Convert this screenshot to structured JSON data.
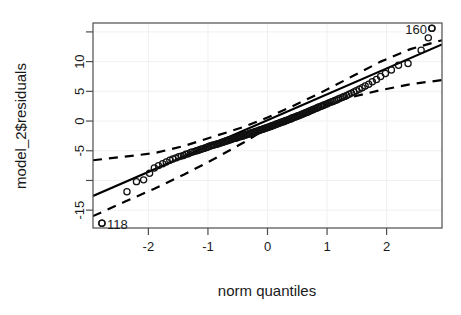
{
  "chart_data": {
    "type": "scatter",
    "title": "",
    "xlabel": "norm quantiles",
    "ylabel": "model_2$residuals",
    "xlim": [
      -2.93,
      2.93
    ],
    "ylim": [
      -18.0,
      16.5
    ],
    "grid": true,
    "legend": null,
    "xticks": [
      -2,
      -1,
      0,
      1,
      2
    ],
    "xticklabels": [
      "-2",
      "-1",
      "0",
      "1",
      "2"
    ],
    "yticks": [
      15,
      10,
      5,
      0,
      -5,
      -10,
      -15
    ],
    "yticklabels": [
      "",
      "10",
      "5",
      "0",
      "-5",
      "",
      "-15"
    ],
    "marker": "open-circle",
    "reference_line": {
      "style": "solid",
      "intercept": 0.15,
      "slope": 4.35
    },
    "confidence_envelope": {
      "style": "dashed",
      "upper": [
        [
          -2.93,
          -6.6
        ],
        [
          -2.4,
          -6.0
        ],
        [
          -1.9,
          -5.4
        ],
        [
          -1.4,
          -4.2
        ],
        [
          -0.9,
          -2.6
        ],
        [
          -0.4,
          -1.0
        ],
        [
          0.0,
          0.6
        ],
        [
          0.4,
          2.4
        ],
        [
          0.9,
          4.8
        ],
        [
          1.4,
          7.4
        ],
        [
          1.9,
          10.0
        ],
        [
          2.4,
          12.1
        ],
        [
          2.93,
          13.6
        ]
      ],
      "lower": [
        [
          -2.93,
          -16.0
        ],
        [
          -2.4,
          -13.6
        ],
        [
          -1.9,
          -11.4
        ],
        [
          -1.4,
          -9.0
        ],
        [
          -0.9,
          -6.4
        ],
        [
          -0.4,
          -3.6
        ],
        [
          0.0,
          -1.2
        ],
        [
          0.4,
          0.7
        ],
        [
          0.9,
          2.6
        ],
        [
          1.4,
          4.0
        ],
        [
          1.9,
          5.2
        ],
        [
          2.4,
          6.2
        ],
        [
          2.93,
          6.9
        ]
      ]
    },
    "annotations": [
      {
        "label": "160",
        "x": 2.76,
        "y": 15.6,
        "position": "left"
      },
      {
        "label": "118",
        "x": -2.78,
        "y": -17.2,
        "position": "right"
      }
    ],
    "points": [
      [
        -2.78,
        -17.2
      ],
      [
        -2.36,
        -11.9
      ],
      [
        -2.2,
        -10.2
      ],
      [
        -2.08,
        -9.9
      ],
      [
        -1.98,
        -8.8
      ],
      [
        -1.9,
        -7.9
      ],
      [
        -1.83,
        -7.5
      ],
      [
        -1.76,
        -7.2
      ],
      [
        -1.7,
        -6.9
      ],
      [
        -1.64,
        -6.6
      ],
      [
        -1.59,
        -6.4
      ],
      [
        -1.54,
        -6.2
      ],
      [
        -1.49,
        -6.0
      ],
      [
        -1.45,
        -5.9
      ],
      [
        -1.41,
        -5.8
      ],
      [
        -1.37,
        -5.6
      ],
      [
        -1.33,
        -5.5
      ],
      [
        -1.29,
        -5.3
      ],
      [
        -1.26,
        -5.2
      ],
      [
        -1.22,
        -5.1
      ],
      [
        -1.19,
        -5.0
      ],
      [
        -1.16,
        -4.9
      ],
      [
        -1.13,
        -4.8
      ],
      [
        -1.1,
        -4.7
      ],
      [
        -1.07,
        -4.6
      ],
      [
        -1.04,
        -4.5
      ],
      [
        -1.01,
        -4.4
      ],
      [
        -0.99,
        -4.3
      ],
      [
        -0.96,
        -4.2
      ],
      [
        -0.94,
        -4.1
      ],
      [
        -0.91,
        -4.05
      ],
      [
        -0.89,
        -4.0
      ],
      [
        -0.86,
        -3.9
      ],
      [
        -0.84,
        -3.85
      ],
      [
        -0.82,
        -3.8
      ],
      [
        -0.79,
        -3.7
      ],
      [
        -0.77,
        -3.6
      ],
      [
        -0.75,
        -3.55
      ],
      [
        -0.73,
        -3.5
      ],
      [
        -0.71,
        -3.4
      ],
      [
        -0.69,
        -3.35
      ],
      [
        -0.67,
        -3.3
      ],
      [
        -0.65,
        -3.2
      ],
      [
        -0.63,
        -3.15
      ],
      [
        -0.61,
        -3.1
      ],
      [
        -0.59,
        -3.0
      ],
      [
        -0.57,
        -2.95
      ],
      [
        -0.55,
        -2.9
      ],
      [
        -0.53,
        -2.85
      ],
      [
        -0.51,
        -2.8
      ],
      [
        -0.49,
        -2.7
      ],
      [
        -0.47,
        -2.65
      ],
      [
        -0.45,
        -2.6
      ],
      [
        -0.43,
        -2.55
      ],
      [
        -0.41,
        -2.5
      ],
      [
        -0.4,
        -2.4
      ],
      [
        -0.38,
        -2.35
      ],
      [
        -0.36,
        -2.3
      ],
      [
        -0.34,
        -2.25
      ],
      [
        -0.32,
        -2.2
      ],
      [
        -0.3,
        -2.1
      ],
      [
        -0.29,
        -2.05
      ],
      [
        -0.27,
        -2.0
      ],
      [
        -0.25,
        -1.95
      ],
      [
        -0.23,
        -1.9
      ],
      [
        -0.21,
        -1.8
      ],
      [
        -0.2,
        -1.75
      ],
      [
        -0.18,
        -1.7
      ],
      [
        -0.16,
        -1.65
      ],
      [
        -0.14,
        -1.6
      ],
      [
        -0.13,
        -1.5
      ],
      [
        -0.11,
        -1.45
      ],
      [
        -0.09,
        -1.4
      ],
      [
        -0.07,
        -1.35
      ],
      [
        -0.06,
        -1.3
      ],
      [
        -0.04,
        -1.2
      ],
      [
        -0.02,
        -1.15
      ],
      [
        0.0,
        -1.1
      ],
      [
        0.02,
        -1.0
      ],
      [
        0.04,
        -0.95
      ],
      [
        0.06,
        -0.9
      ],
      [
        0.07,
        -0.8
      ],
      [
        0.09,
        -0.75
      ],
      [
        0.11,
        -0.7
      ],
      [
        0.13,
        -0.6
      ],
      [
        0.14,
        -0.55
      ],
      [
        0.16,
        -0.5
      ],
      [
        0.18,
        -0.4
      ],
      [
        0.2,
        -0.35
      ],
      [
        0.21,
        -0.3
      ],
      [
        0.23,
        -0.2
      ],
      [
        0.25,
        -0.15
      ],
      [
        0.27,
        -0.1
      ],
      [
        0.29,
        0.0
      ],
      [
        0.3,
        0.05
      ],
      [
        0.32,
        0.1
      ],
      [
        0.34,
        0.2
      ],
      [
        0.36,
        0.25
      ],
      [
        0.38,
        0.35
      ],
      [
        0.4,
        0.4
      ],
      [
        0.41,
        0.5
      ],
      [
        0.43,
        0.55
      ],
      [
        0.45,
        0.65
      ],
      [
        0.47,
        0.7
      ],
      [
        0.49,
        0.8
      ],
      [
        0.51,
        0.85
      ],
      [
        0.53,
        0.95
      ],
      [
        0.55,
        1.0
      ],
      [
        0.57,
        1.1
      ],
      [
        0.59,
        1.2
      ],
      [
        0.61,
        1.25
      ],
      [
        0.63,
        1.35
      ],
      [
        0.65,
        1.45
      ],
      [
        0.67,
        1.5
      ],
      [
        0.69,
        1.6
      ],
      [
        0.71,
        1.7
      ],
      [
        0.73,
        1.8
      ],
      [
        0.75,
        1.85
      ],
      [
        0.77,
        1.95
      ],
      [
        0.79,
        2.05
      ],
      [
        0.82,
        2.15
      ],
      [
        0.84,
        2.25
      ],
      [
        0.86,
        2.35
      ],
      [
        0.89,
        2.45
      ],
      [
        0.91,
        2.55
      ],
      [
        0.94,
        2.65
      ],
      [
        0.96,
        2.75
      ],
      [
        0.99,
        2.85
      ],
      [
        1.01,
        2.95
      ],
      [
        1.04,
        3.1
      ],
      [
        1.07,
        3.2
      ],
      [
        1.1,
        3.3
      ],
      [
        1.13,
        3.45
      ],
      [
        1.16,
        3.55
      ],
      [
        1.19,
        3.7
      ],
      [
        1.22,
        3.85
      ],
      [
        1.26,
        4.0
      ],
      [
        1.29,
        4.15
      ],
      [
        1.33,
        4.3
      ],
      [
        1.37,
        4.5
      ],
      [
        1.41,
        4.7
      ],
      [
        1.45,
        4.9
      ],
      [
        1.49,
        5.1
      ],
      [
        1.54,
        5.35
      ],
      [
        1.59,
        5.6
      ],
      [
        1.64,
        5.9
      ],
      [
        1.7,
        6.2
      ],
      [
        1.76,
        6.6
      ],
      [
        1.83,
        7.0
      ],
      [
        1.9,
        7.5
      ],
      [
        1.98,
        8.0
      ],
      [
        2.08,
        8.6
      ],
      [
        2.2,
        9.4
      ],
      [
        2.36,
        9.7
      ],
      [
        2.58,
        11.9
      ],
      [
        2.7,
        14.0
      ],
      [
        2.76,
        15.6
      ]
    ]
  },
  "figure": {
    "background_color": "#ffffff",
    "point_color": "#111111",
    "line_color": "#000000",
    "grid_color": "#f0f0f0",
    "axis_color": "#4d4d4d"
  }
}
